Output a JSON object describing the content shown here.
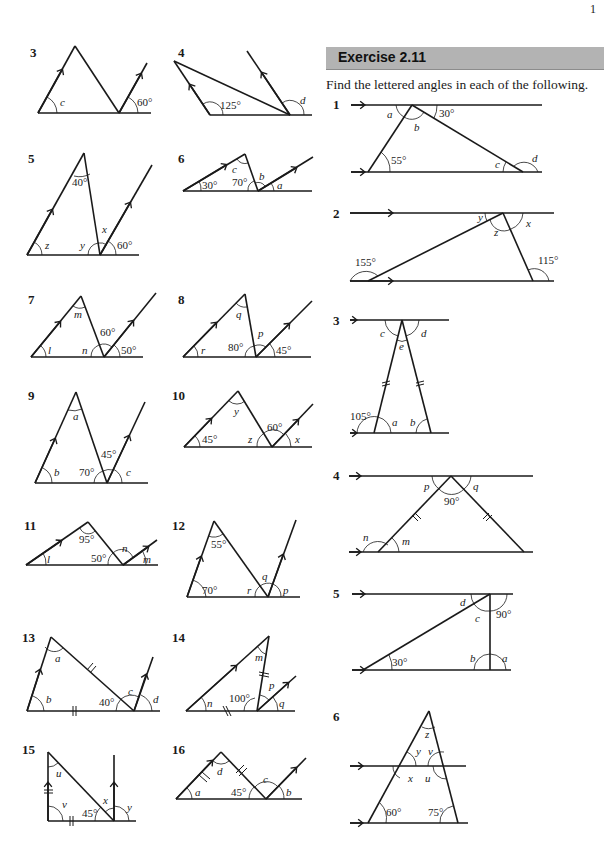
{
  "page": {
    "page_number": "1",
    "exercise_title": "Exercise 2.11",
    "instructions": "Find the lettered angles in each of the following."
  },
  "left_column": {
    "questions": [
      {
        "number": "3",
        "labels": {
          "c": "c",
          "angle1": "60°"
        }
      },
      {
        "number": "4",
        "labels": {
          "angle1": "125°",
          "d": "d"
        }
      },
      {
        "number": "5",
        "labels": {
          "angle1": "40°",
          "z": "z",
          "y": "y",
          "x": "x",
          "angle2": "60°"
        }
      },
      {
        "number": "6",
        "labels": {
          "angle1": "30°",
          "angle2": "70°",
          "c": "c",
          "b": "b",
          "a": "a"
        }
      },
      {
        "number": "7",
        "labels": {
          "m": "m",
          "l": "l",
          "n": "n",
          "angle1": "60°",
          "angle2": "50°"
        }
      },
      {
        "number": "8",
        "labels": {
          "q": "q",
          "r": "r",
          "angle1": "80°",
          "p": "p",
          "angle2": "45°"
        }
      },
      {
        "number": "9",
        "labels": {
          "a": "a",
          "b": "b",
          "angle1": "70°",
          "angle2": "45°",
          "c": "c"
        }
      },
      {
        "number": "10",
        "labels": {
          "y": "y",
          "angle1": "45°",
          "z": "z",
          "angle2": "60°",
          "x": "x"
        }
      },
      {
        "number": "11",
        "labels": {
          "angle1": "95°",
          "l": "l",
          "angle2": "50°",
          "n": "n",
          "m": "m"
        }
      },
      {
        "number": "12",
        "labels": {
          "angle1": "55°",
          "angle2": "70°",
          "r": "r",
          "q": "q",
          "p": "p"
        }
      },
      {
        "number": "13",
        "labels": {
          "a": "a",
          "b": "b",
          "angle1": "40°",
          "c": "c",
          "d": "d"
        }
      },
      {
        "number": "14",
        "labels": {
          "m": "m",
          "n": "n",
          "angle1": "100°",
          "p": "p",
          "q": "q"
        }
      },
      {
        "number": "15",
        "labels": {
          "u": "u",
          "v": "v",
          "angle1": "45°",
          "x": "x",
          "y": "y"
        }
      },
      {
        "number": "16",
        "labels": {
          "a": "a",
          "d": "d",
          "angle1": "45°",
          "c": "c",
          "b": "b"
        }
      }
    ]
  },
  "right_column": {
    "questions": [
      {
        "number": "1",
        "labels": {
          "a": "a",
          "b": "b",
          "angle1": "30°",
          "angle2": "55°",
          "c": "c",
          "d": "d"
        }
      },
      {
        "number": "2",
        "labels": {
          "y": "y",
          "z": "z",
          "x": "x",
          "angle1": "155°",
          "angle2": "115°"
        }
      },
      {
        "number": "3",
        "labels": {
          "c": "c",
          "e": "e",
          "d": "d",
          "angle1": "105°",
          "a": "a",
          "b": "b"
        }
      },
      {
        "number": "4",
        "labels": {
          "p": "p",
          "q": "q",
          "angle1": "90°",
          "n": "n",
          "m": "m"
        }
      },
      {
        "number": "5",
        "labels": {
          "d": "d",
          "c": "c",
          "angle1": "90°",
          "angle2": "30°",
          "b": "b",
          "a": "a"
        }
      },
      {
        "number": "6",
        "labels": {
          "z": "z",
          "y": "y",
          "v": "v",
          "x": "x",
          "u": "u",
          "angle1": "60°",
          "angle2": "75°"
        }
      }
    ]
  }
}
